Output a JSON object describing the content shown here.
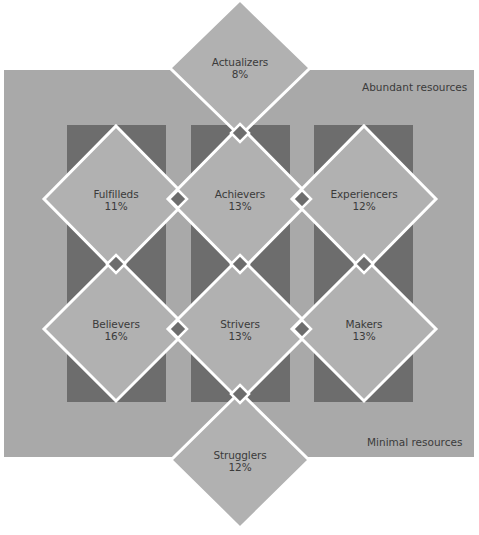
{
  "diagram": {
    "colors": {
      "background": "#a9a9a9",
      "column": "#6d6d6d",
      "diamond": "#b1b1b1",
      "outline": "#ffffff",
      "connector": "#6d6d6d",
      "text": "#3b3b3b"
    },
    "corner_labels": {
      "top": "Abundant resources",
      "bottom": "Minimal resources"
    },
    "segments": [
      {
        "name": "Actualizers",
        "percent": "8%"
      },
      {
        "name": "Fulfilleds",
        "percent": "11%"
      },
      {
        "name": "Achievers",
        "percent": "13%"
      },
      {
        "name": "Experiencers",
        "percent": "12%"
      },
      {
        "name": "Believers",
        "percent": "16%"
      },
      {
        "name": "Strivers",
        "percent": "13%"
      },
      {
        "name": "Makers",
        "percent": "13%"
      },
      {
        "name": "Strugglers",
        "percent": "12%"
      }
    ]
  }
}
